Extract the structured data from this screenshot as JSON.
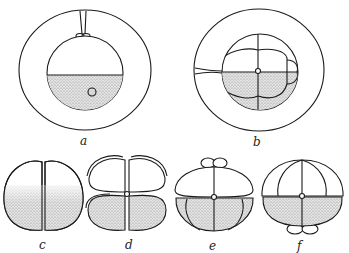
{
  "figure": {
    "type": "embryo cleavage stages",
    "panels": [
      {
        "id": "a",
        "label": "a",
        "description": "fertilized egg within envelope, yolk stippled at bottom"
      },
      {
        "id": "b",
        "label": "b",
        "description": "8-cell stage within envelope"
      },
      {
        "id": "c",
        "label": "c",
        "description": "2-cell stage"
      },
      {
        "id": "d",
        "label": "d",
        "description": "4-cell stage"
      },
      {
        "id": "e",
        "label": "e",
        "description": "8-cell stage with micromeres at top"
      },
      {
        "id": "f",
        "label": "f",
        "description": "8-cell stage with micromeres at bottom"
      }
    ],
    "colors": {
      "line": "#1a1a1a",
      "stipple": "#bdbdbd",
      "background": "#ffffff"
    }
  }
}
